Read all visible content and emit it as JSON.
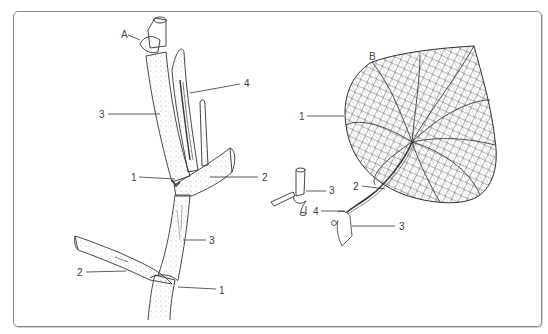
{
  "figure": {
    "panel_a": {
      "letter": "A",
      "labels": [
        {
          "text": "4",
          "x": 244,
          "y": 79
        },
        {
          "text": "3",
          "x": 99,
          "y": 110
        },
        {
          "text": "1",
          "x": 131,
          "y": 173
        },
        {
          "text": "2",
          "x": 262,
          "y": 173
        },
        {
          "text": "3",
          "x": 209,
          "y": 236
        },
        {
          "text": "2",
          "x": 77,
          "y": 268
        },
        {
          "text": "1",
          "x": 219,
          "y": 286
        }
      ]
    },
    "panel_b": {
      "letter": "B",
      "labels": [
        {
          "text": "1",
          "x": 299,
          "y": 112
        },
        {
          "text": "3",
          "x": 331,
          "y": 186
        },
        {
          "text": "2",
          "x": 353,
          "y": 182
        },
        {
          "text": "4",
          "x": 313,
          "y": 209
        },
        {
          "text": "3",
          "x": 399,
          "y": 223
        }
      ]
    },
    "colors": {
      "ink": "#3a3a3a",
      "frame": "#8a8a8a",
      "letter": "#3c4a55"
    }
  }
}
